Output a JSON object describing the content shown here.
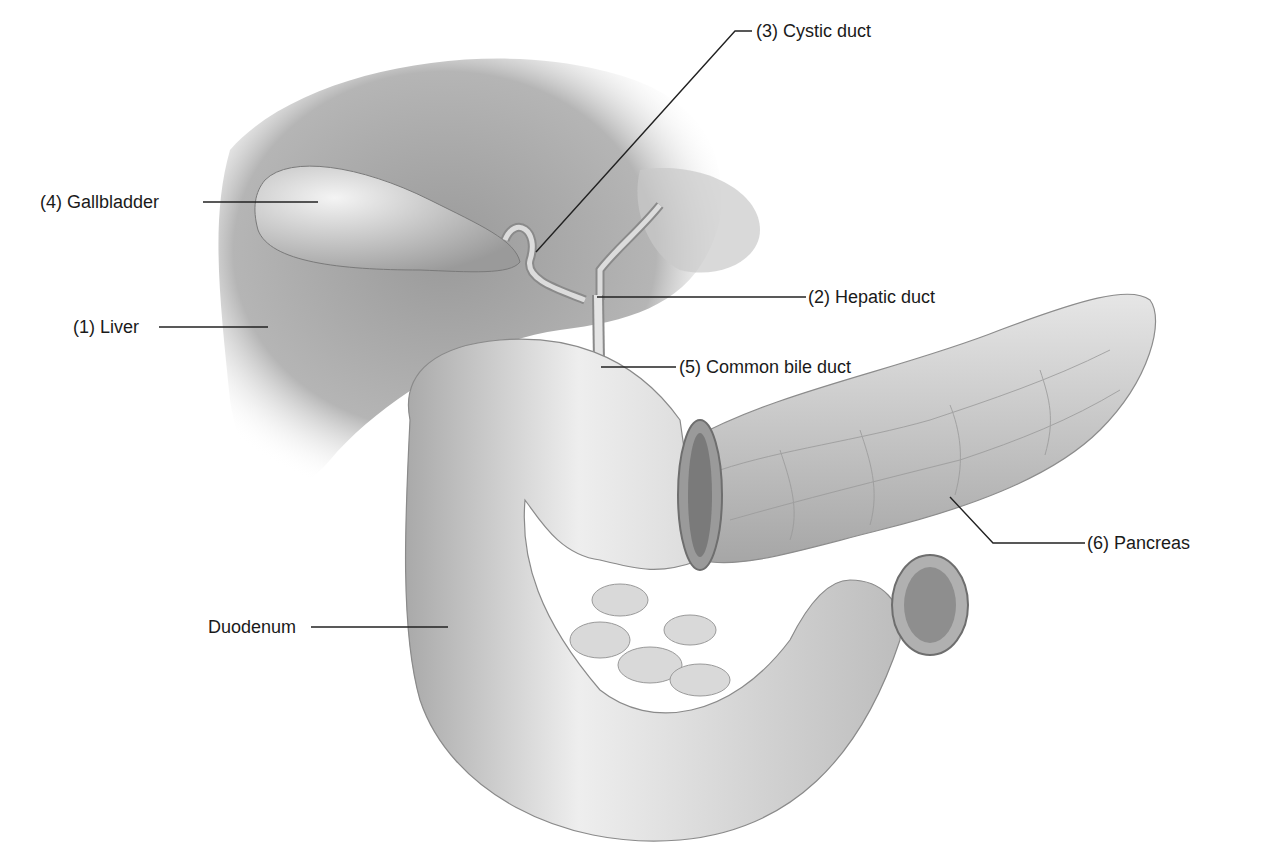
{
  "figure": {
    "style": "grayscale pencil anatomical illustration",
    "colors": {
      "background": "#ffffff",
      "ink": "#1a1a1a",
      "organ_mid": "#a8a8a8",
      "organ_light": "#e2e2e2",
      "organ_dark": "#6e6e6e"
    }
  },
  "labels": [
    {
      "id": "cystic-duct",
      "number": "3",
      "text": "(3) Cystic duct"
    },
    {
      "id": "gallbladder",
      "number": "4",
      "text": "(4) Gallbladder"
    },
    {
      "id": "hepatic-duct",
      "number": "2",
      "text": "(2) Hepatic duct"
    },
    {
      "id": "liver",
      "number": "1",
      "text": "(1) Liver"
    },
    {
      "id": "common-bile-duct",
      "number": "5",
      "text": "(5) Common bile duct"
    },
    {
      "id": "pancreas",
      "number": "6",
      "text": "(6) Pancreas"
    },
    {
      "id": "duodenum",
      "number": "",
      "text": "Duodenum"
    }
  ],
  "signature": "S. Bodnik"
}
